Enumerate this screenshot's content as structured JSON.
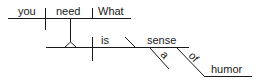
{
  "diagram": {
    "type": "sentence-diagram",
    "words": {
      "subject": "you",
      "verb": "need",
      "object": "What",
      "clause_subject": "is",
      "predicate_noun": "sense",
      "article": "a",
      "preposition": "of",
      "prep_object": "humor"
    },
    "line_color": "#1a1a1a",
    "text_color": "#1a1a1a"
  }
}
